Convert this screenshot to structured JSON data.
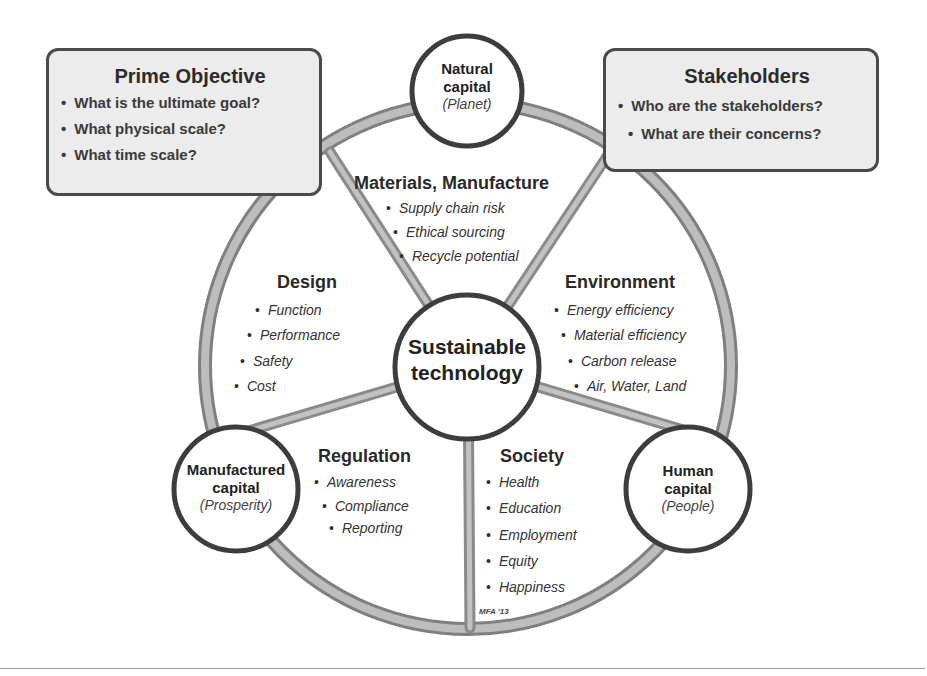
{
  "boxes": {
    "prime_objective": {
      "title": "Prime Objective",
      "items": [
        "What is the ultimate goal?",
        "What physical scale?",
        "What time scale?"
      ]
    },
    "stakeholders": {
      "title": "Stakeholders",
      "items": [
        "Who are the stakeholders?",
        "What are their concerns?"
      ]
    }
  },
  "center": {
    "line1": "Sustainable",
    "line2": "technology"
  },
  "capitals": {
    "natural": {
      "line1": "Natural",
      "line2": "capital",
      "sub": "(Planet)"
    },
    "manufactured": {
      "line1": "Manufactured",
      "line2": "capital",
      "sub": "(Prosperity)"
    },
    "human": {
      "line1": "Human",
      "line2": "capital",
      "sub": "(People)"
    }
  },
  "segments": {
    "materials": {
      "title": "Materials, Manufacture",
      "items": [
        "Supply chain risk",
        "Ethical sourcing",
        "Recycle potential"
      ]
    },
    "design": {
      "title": "Design",
      "items": [
        "Function",
        "Performance",
        "Safety",
        "Cost"
      ]
    },
    "environment": {
      "title": "Environment",
      "items": [
        "Energy efficiency",
        "Material efficiency",
        "Carbon release",
        "Air, Water, Land"
      ]
    },
    "regulation": {
      "title": "Regulation",
      "items": [
        "Awareness",
        "Compliance",
        "Reporting"
      ]
    },
    "society": {
      "title": "Society",
      "items": [
        "Health",
        "Education",
        "Employment",
        "Equity",
        "Happiness"
      ]
    }
  },
  "credit": "MFA '13",
  "colors": {
    "rim": "#a9a9a9",
    "rim_edge": "#7a7a7a",
    "circle_stroke": "#3d3d3d",
    "box_fill": "#ececec"
  }
}
